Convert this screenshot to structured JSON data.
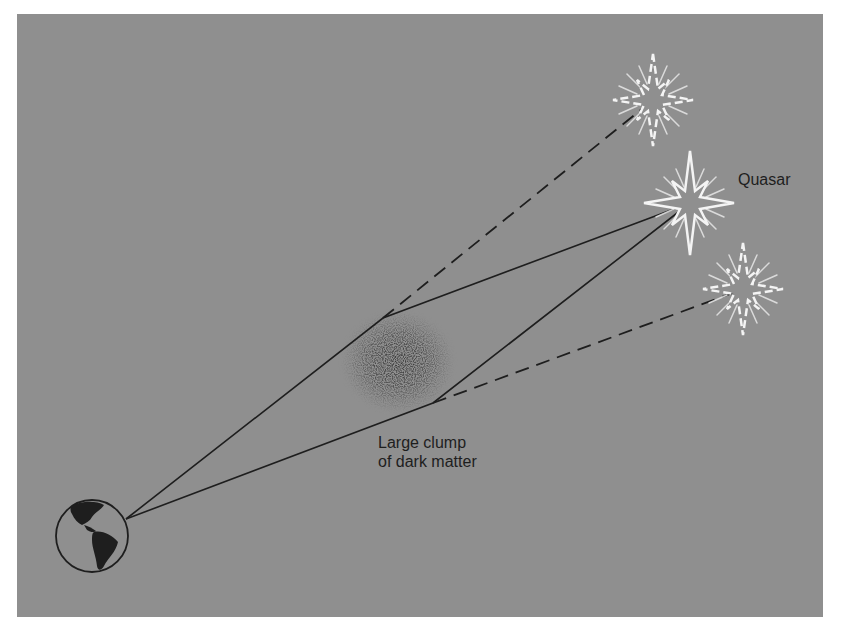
{
  "diagram": {
    "type": "gravitational-lensing-illustration",
    "labels": {
      "quasar": "Quasar",
      "clump_line1": "Large clump",
      "clump_line2": "of dark matter"
    },
    "colors": {
      "background": "#8f8f8f",
      "line": "#1e1e1e",
      "star": "#f4f4f4"
    },
    "nodes": {
      "earth": {
        "x": 92,
        "y": 536,
        "r": 36
      },
      "dark_matter_clump": {
        "x": 398,
        "y": 362,
        "rx": 58,
        "ry": 52
      },
      "quasar_real": {
        "x": 690,
        "y": 203
      },
      "quasar_image_upper": {
        "x": 653,
        "y": 100
      },
      "quasar_image_lower": {
        "x": 743,
        "y": 289
      }
    },
    "paths": [
      {
        "name": "upper-light-path",
        "style": "solid",
        "points": [
          [
            126,
            519
          ],
          [
            383,
            318
          ],
          [
            690,
            203
          ]
        ]
      },
      {
        "name": "lower-light-path",
        "style": "solid",
        "points": [
          [
            126,
            519
          ],
          [
            433,
            403
          ],
          [
            690,
            203
          ]
        ]
      },
      {
        "name": "upper-apparent-ray",
        "style": "dashed",
        "points": [
          [
            383,
            318
          ],
          [
            653,
            100
          ]
        ]
      },
      {
        "name": "lower-apparent-ray",
        "style": "dashed",
        "points": [
          [
            433,
            403
          ],
          [
            743,
            289
          ]
        ]
      }
    ]
  }
}
